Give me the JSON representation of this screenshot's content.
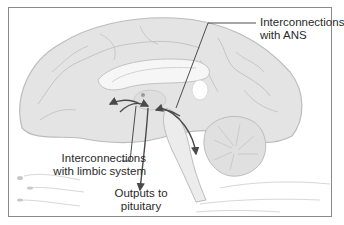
{
  "diagram": {
    "type": "anatomical-illustration",
    "labels": {
      "ans": {
        "line1": "Interconnections",
        "line2": "with ANS"
      },
      "limbic": {
        "line1": "Interconnections",
        "line2": "with limbic system"
      },
      "pituitary": {
        "line1": "Outputs to",
        "line2": "pituitary"
      }
    },
    "colors": {
      "brain_fill": "#e3e3e3",
      "brain_stroke": "#b9b9b9",
      "arrow": "#4a4a4a",
      "leader_line": "#3a3a3a",
      "frame": "#8a8a8a"
    }
  }
}
